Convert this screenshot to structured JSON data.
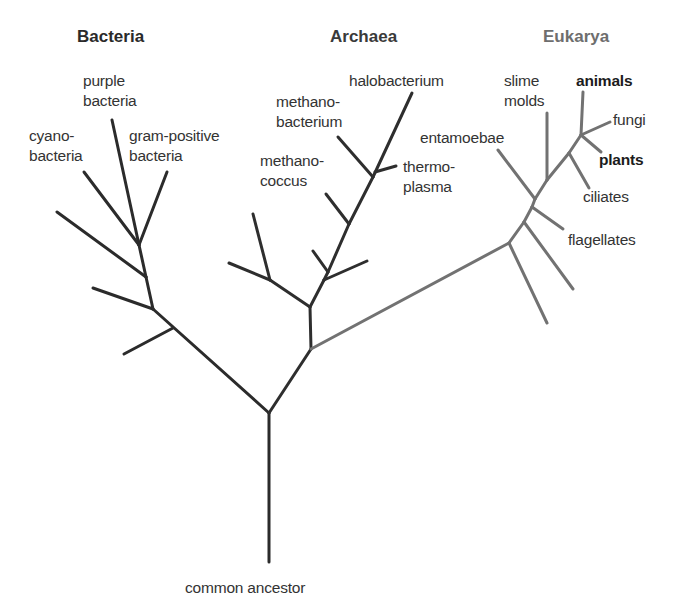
{
  "colors": {
    "bacteria_archaea_branch": "#2b2b2b",
    "eukarya_branch": "#727272",
    "bacteria_header": "#2a2a2a",
    "archaea_header": "#3a3a3a",
    "eukarya_header": "#6e6e6e",
    "label_text": "#333333"
  },
  "domains": {
    "bacteria": {
      "name": "Bacteria",
      "taxa": {
        "purple_bacteria": [
          "purple",
          "bacteria"
        ],
        "cyanobacteria": [
          "cyano-",
          "bacteria"
        ],
        "gram_positive": [
          "gram-positive",
          "bacteria"
        ]
      }
    },
    "archaea": {
      "name": "Archaea",
      "taxa": {
        "halobacterium": [
          "halobacterium"
        ],
        "methanobacterium": [
          "methano-",
          "bacterium"
        ],
        "methanococcus": [
          "methano-",
          "coccus"
        ],
        "thermoplasma": [
          "thermo-",
          "plasma"
        ]
      }
    },
    "eukarya": {
      "name": "Eukarya",
      "taxa": {
        "slime_molds": [
          "slime",
          "molds"
        ],
        "animals": [
          "animals"
        ],
        "fungi": [
          "fungi"
        ],
        "entamoebae": [
          "entamoebae"
        ],
        "plants": [
          "plants"
        ],
        "ciliates": [
          "ciliates"
        ],
        "flagellates": [
          "flagellates"
        ]
      }
    }
  },
  "root": {
    "label": "common ancestor"
  }
}
